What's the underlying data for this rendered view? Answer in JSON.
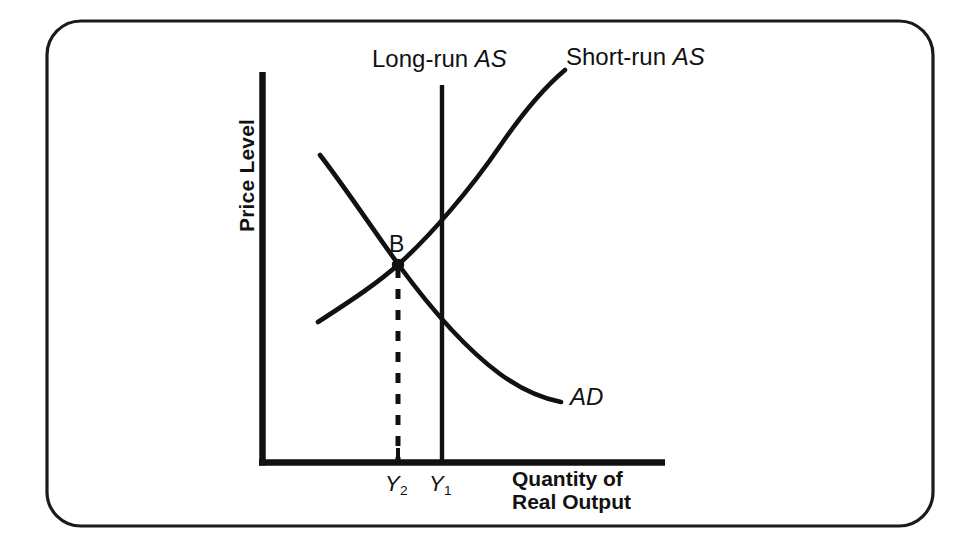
{
  "figure": {
    "kind": "ad-as-diagram",
    "frame": {
      "border_color": "#1a1a1a",
      "background": "#ffffff",
      "corner_radius": 34
    },
    "ink_color": "#111111"
  },
  "axes": {
    "y_title": "Price Level",
    "x_title_line1": "Quantity of",
    "x_title_line2": "Real Output",
    "origin": {
      "x": 261,
      "y": 464
    },
    "y_top": 72,
    "x_right": 665,
    "axis_width": 6
  },
  "curves": {
    "long_run_as": {
      "label": "Long-run ",
      "label_italic": "AS",
      "label_x": 372,
      "label_y": 46,
      "type": "vertical-line",
      "x": 442,
      "y_top": 85,
      "y_bottom": 464
    },
    "short_run_as": {
      "label": "Short-run ",
      "label_italic": "AS",
      "label_x": 566,
      "label_y": 44,
      "type": "upward-sloping-curve",
      "start": {
        "x": 318,
        "y": 322
      },
      "end": {
        "x": 565,
        "y": 70
      }
    },
    "aggregate_demand": {
      "label": "AD",
      "label_x": 570,
      "label_y": 384,
      "type": "downward-sloping-curve",
      "start": {
        "x": 320,
        "y": 155
      },
      "end": {
        "x": 561,
        "y": 402
      }
    }
  },
  "points": [
    {
      "name": "B",
      "label": "B",
      "label_x": 389,
      "label_y": 232,
      "x": 398,
      "y": 265,
      "dot_radius": 6
    }
  ],
  "guides": {
    "dashed_drop_line": {
      "x": 398,
      "y_from": 268,
      "y_to": 464,
      "dash": "10 11",
      "width": 5
    }
  },
  "ticks": [
    {
      "label": "Y",
      "sub": "2",
      "x": 398,
      "text_x": 385,
      "text_y": 472,
      "tick_height": 14
    },
    {
      "label": "Y",
      "sub": "1",
      "x": 442,
      "text_x": 429,
      "text_y": 472,
      "tick_height": 0
    }
  ],
  "x_title_position": {
    "x": 512,
    "y": 468
  },
  "y_title_position": {
    "x": 238,
    "y": 232
  }
}
